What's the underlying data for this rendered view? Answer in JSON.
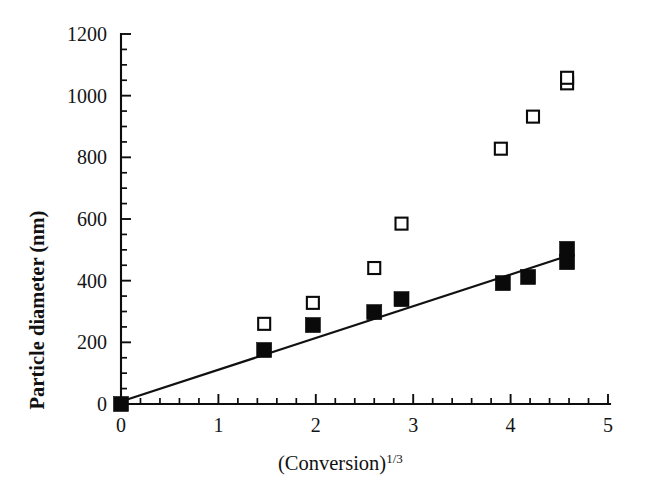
{
  "figure": {
    "background_color": "#ffffff",
    "ink_color": "#0d0d0d"
  },
  "chart_data": {
    "type": "scatter",
    "title": "",
    "xlabel": "(Conversion)1/3",
    "xlabel_base": "(Conversion)",
    "xlabel_exponent": "1/3",
    "ylabel": "Particle diameter (nm)",
    "xlim": [
      0,
      5
    ],
    "ylim": [
      0,
      1200
    ],
    "xticks": [
      0,
      1,
      2,
      3,
      4,
      5
    ],
    "xticklabels": [
      "0",
      "1",
      "2",
      "3",
      "4",
      "5"
    ],
    "x_minor_tick_interval": 0.2,
    "yticks": [
      0,
      200,
      400,
      600,
      800,
      1000,
      1200
    ],
    "yticklabels": [
      "0",
      "200",
      "400",
      "600",
      "800",
      "1000",
      "1200"
    ],
    "y_minor_tick_interval": 50,
    "grid": false,
    "legend": false,
    "legend_position": "none",
    "series": [
      {
        "name": "filled-squares",
        "marker": "filled square",
        "marker_color": "#0a0a0a",
        "points": [
          {
            "x": 0.0,
            "y": 0
          },
          {
            "x": 1.47,
            "y": 175
          },
          {
            "x": 1.97,
            "y": 256
          },
          {
            "x": 2.6,
            "y": 298
          },
          {
            "x": 2.88,
            "y": 340
          },
          {
            "x": 3.92,
            "y": 392
          },
          {
            "x": 4.18,
            "y": 412
          },
          {
            "x": 4.58,
            "y": 460
          },
          {
            "x": 4.58,
            "y": 503
          }
        ]
      },
      {
        "name": "open-squares",
        "marker": "open square",
        "marker_color": "#ffffff",
        "marker_edge_color": "#0a0a0a",
        "points": [
          {
            "x": 1.47,
            "y": 260
          },
          {
            "x": 1.97,
            "y": 328
          },
          {
            "x": 2.6,
            "y": 441
          },
          {
            "x": 2.88,
            "y": 585
          },
          {
            "x": 3.9,
            "y": 828
          },
          {
            "x": 4.23,
            "y": 932
          },
          {
            "x": 4.58,
            "y": 1040
          },
          {
            "x": 4.58,
            "y": 1058
          }
        ]
      }
    ],
    "fit_line": {
      "name": "linear-fit",
      "x_start": 0.0,
      "y_start": 8,
      "x_end": 4.62,
      "y_end": 484,
      "slope": 103,
      "intercept": 8
    },
    "annotations": []
  }
}
